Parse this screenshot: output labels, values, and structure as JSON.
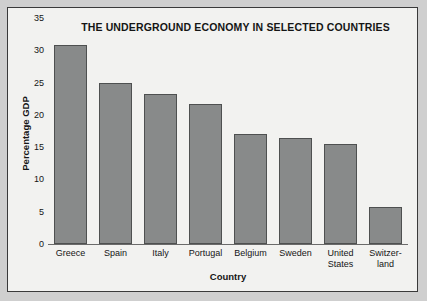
{
  "chart_data": {
    "type": "bar",
    "title": "THE UNDERGROUND ECONOMY IN SELECTED COUNTRIES",
    "xlabel": "Country",
    "ylabel": "Percentage GDP",
    "categories": [
      "Greece",
      "Spain",
      "Italy",
      "Portugal",
      "Belgium",
      "Sweden",
      "United States",
      "Switzerland"
    ],
    "category_lines": [
      [
        "Greece"
      ],
      [
        "Spain"
      ],
      [
        "Italy"
      ],
      [
        "Portugal"
      ],
      [
        "Belgium"
      ],
      [
        "Sweden"
      ],
      [
        "United",
        "States"
      ],
      [
        "Switzer-",
        "land"
      ]
    ],
    "values": [
      30.8,
      24.9,
      23.3,
      21.7,
      17.0,
      16.4,
      15.5,
      5.8
    ],
    "ylim": [
      0,
      35
    ],
    "yticks": [
      0,
      5,
      10,
      15,
      20,
      25,
      30,
      35
    ],
    "ytick_labels": [
      "0",
      "5",
      "10",
      "15",
      "20",
      "25",
      "30",
      "35"
    ],
    "grid": false,
    "legend": "none",
    "bar_color": "#888a8a",
    "bar_edge_color": "#4e5050",
    "plot_background": "#f2f2f0",
    "figure_background": "#cfcfcf",
    "frame_color": "#3a3a3a",
    "text_color": "#151515"
  }
}
